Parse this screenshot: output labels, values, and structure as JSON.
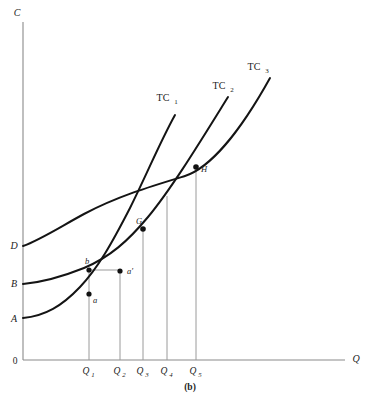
{
  "figure": {
    "caption": "(b)",
    "axes": {
      "y_label": "C",
      "x_label": "Q",
      "origin_label": "0"
    },
    "intercepts": [
      {
        "label": "D",
        "curve": "long-run-average-cost",
        "y_value": 246
      },
      {
        "label": "B",
        "curve": "TC2",
        "y_value": 284
      },
      {
        "label": "A",
        "curve": "TC1",
        "y_value": 318
      }
    ],
    "x_ticks": [
      {
        "label": "Q",
        "sub": "1",
        "x": 89
      },
      {
        "label": "Q",
        "sub": "2",
        "x": 120
      },
      {
        "label": "Q",
        "sub": "3",
        "x": 143
      },
      {
        "label": "Q",
        "sub": "4",
        "x": 167
      },
      {
        "label": "Q",
        "sub": "5",
        "x": 196
      }
    ],
    "curve_labels": [
      {
        "label": "TC",
        "sub": "1",
        "x": 163,
        "y": 101
      },
      {
        "label": "TC",
        "sub": "2",
        "x": 219,
        "y": 89
      },
      {
        "label": "TC",
        "sub": "3",
        "x": 254,
        "y": 70
      }
    ],
    "points": [
      {
        "label": "a",
        "x": 89,
        "y": 294
      },
      {
        "label": "b",
        "x": 89,
        "y": 270
      },
      {
        "label": "a'",
        "x": 120,
        "y": 272
      },
      {
        "label": "G",
        "x": 143,
        "y": 229
      },
      {
        "label": "H",
        "x": 196,
        "y": 167
      }
    ]
  },
  "chart_data": {
    "type": "line",
    "title": "(b)",
    "xlabel": "Q",
    "ylabel": "C",
    "xlim": [
      0,
      345
    ],
    "ylim": [
      0,
      360
    ],
    "grid": false,
    "legend": "inline-curve-labels",
    "categories": [
      "Q1",
      "Q2",
      "Q3",
      "Q4",
      "Q5"
    ],
    "series": [
      {
        "name": "TC1",
        "path": "M 23 318 C 45 316, 62 306, 80 287 C 98 268, 112 243, 130 208 C 146 176, 160 142, 175 115",
        "intercept_label": "A"
      },
      {
        "name": "TC2",
        "path": "M 23 284 C 45 282, 64 276, 84 268 C 110 257, 128 241, 148 217 C 172 188, 200 142, 228 97",
        "intercept_label": "B"
      },
      {
        "name": "TC3",
        "path": "M 23 246 C 40 240, 60 227, 84 214 C 118 196, 152 186, 185 176 C 210 168, 240 132, 270 78",
        "intercept_label": "D"
      }
    ],
    "annotations": [
      {
        "text": "a",
        "x": 89,
        "y": 294,
        "note": "point on TC1 at Q1"
      },
      {
        "text": "b",
        "x": 89,
        "y": 270,
        "note": "point on TC2 at Q1"
      },
      {
        "text": "a'",
        "x": 120,
        "y": 272,
        "note": "point on TC2 at Q2"
      },
      {
        "text": "G",
        "x": 143,
        "y": 229,
        "note": "intersection of TC1 and TC2 at Q3"
      },
      {
        "text": "H",
        "x": 196,
        "y": 167,
        "note": "intersection of TC2 and TC3 at Q5"
      }
    ]
  }
}
